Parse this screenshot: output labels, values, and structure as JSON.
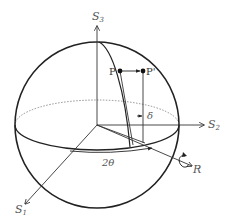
{
  "diagram": {
    "type": "poincare-sphere",
    "axes": {
      "s1": {
        "label": "S",
        "sub": "1"
      },
      "s2": {
        "label": "S",
        "sub": "2"
      },
      "s3": {
        "label": "S",
        "sub": "3"
      },
      "r": {
        "label": "R"
      }
    },
    "points": {
      "p": {
        "label": "P"
      },
      "p_prime": {
        "label": "P'"
      }
    },
    "angles": {
      "delta": {
        "label": "δ"
      },
      "two_theta": {
        "label": "2θ"
      }
    },
    "colors": {
      "stroke": "#222222",
      "label": "#555555",
      "background": "#ffffff"
    }
  }
}
